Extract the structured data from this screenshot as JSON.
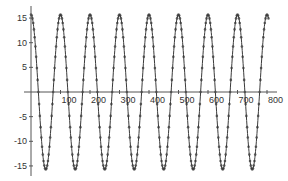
{
  "chart_data": {
    "type": "scatter",
    "title": "",
    "xlabel": "",
    "ylabel": "",
    "x_ticks": [
      100,
      200,
      300,
      400,
      500,
      600,
      700,
      800
    ],
    "y_ticks": [
      -15,
      -10,
      -5,
      5,
      10,
      15
    ],
    "xlim": [
      0,
      830
    ],
    "ylim": [
      -17,
      17
    ],
    "grid": false,
    "legend": null,
    "series": [
      {
        "name": "sinusoid",
        "function": "y = 15.7 * cos(2*pi*x/100)",
        "amplitude": 15.7,
        "period": 100,
        "x_start": 0,
        "x_end": 805,
        "marker": "dot",
        "color": "#3a3a3a",
        "peaks_x": [
          0,
          100,
          200,
          300,
          400,
          500,
          600,
          700,
          800
        ],
        "troughs_x": [
          50,
          150,
          250,
          350,
          450,
          550,
          650,
          750
        ]
      }
    ]
  },
  "style": {
    "axis_color": "#555555",
    "marker_color": "#3a3a3a",
    "background": "#ffffff"
  }
}
